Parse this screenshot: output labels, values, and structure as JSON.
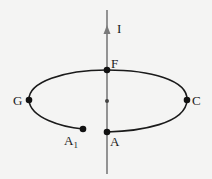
{
  "diagram": {
    "type": "current-loop-around-wire",
    "wire": {
      "current_label": "I",
      "direction": "up",
      "color": "#777777"
    },
    "loop": {
      "shape": "ellipse-open",
      "color": "#1a1a1a",
      "gap_between": [
        "A1",
        "A"
      ]
    },
    "points": [
      {
        "id": "F",
        "label": "F"
      },
      {
        "id": "G",
        "label": "G"
      },
      {
        "id": "C",
        "label": "C"
      },
      {
        "id": "A1",
        "label": "A",
        "subscript": "1"
      },
      {
        "id": "A",
        "label": "A"
      },
      {
        "id": "center",
        "label": ""
      }
    ]
  }
}
